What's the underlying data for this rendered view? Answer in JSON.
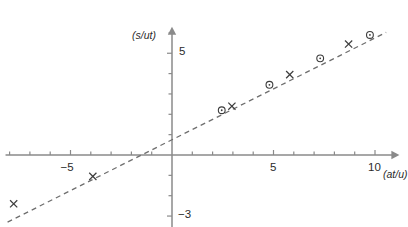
{
  "chart_data": {
    "type": "scatter",
    "title": "",
    "subtitle": "",
    "xlabel": "(at/u)",
    "ylabel": "(s/ut)",
    "xlim": [
      -8.2,
      11.2
    ],
    "ylim": [
      -3.6,
      6.3
    ],
    "grid": false,
    "legend": "none",
    "x_ticks_major": [
      -5,
      5,
      10
    ],
    "x_tick_labels": [
      "−5",
      "5",
      "10"
    ],
    "y_ticks_major": [
      5,
      -3
    ],
    "y_tick_labels": [
      "5",
      "−3"
    ],
    "x_ticks_minor": [
      -8,
      -7,
      -6,
      -4,
      -3,
      -2,
      -1,
      1,
      2,
      3,
      4,
      6,
      7,
      8,
      9
    ],
    "y_ticks_minor": [
      1,
      2,
      3,
      4,
      6,
      -1,
      -2
    ],
    "series": [
      {
        "name": "circle-series",
        "marker": "circle",
        "x": [
          2.45,
          4.8,
          7.3,
          9.75
        ],
        "y": [
          2.2,
          3.45,
          4.75,
          5.9
        ]
      },
      {
        "name": "cross-series",
        "marker": "cross",
        "x": [
          -7.8,
          -3.9,
          2.95,
          5.8,
          8.7
        ],
        "y": [
          -2.4,
          -1.05,
          2.4,
          3.95,
          5.45
        ]
      }
    ],
    "trendline": {
      "style": "dashed",
      "slope": 0.5,
      "intercept": 0.75,
      "x_start": -8.1,
      "x_end": 10.55,
      "x_intercept": -1.5
    },
    "axis_arrows": [
      "x-positive",
      "y-positive"
    ],
    "colors": {
      "axis": "#8a8a8a",
      "line": "#6e6e6e",
      "marker": "#3c3c3c",
      "text": "#2b2b2b",
      "background": "#ffffff"
    }
  }
}
